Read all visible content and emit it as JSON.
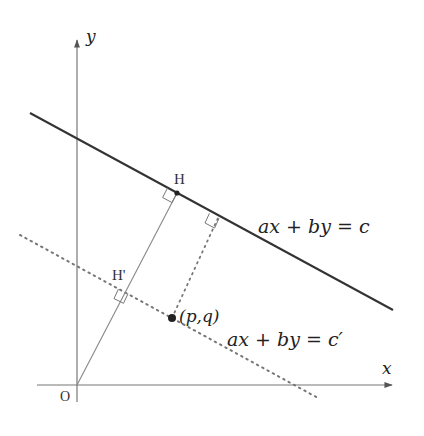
{
  "diagram": {
    "type": "coordinate-geometry",
    "axes": {
      "x_label": "x",
      "y_label": "y",
      "origin_label": "O"
    },
    "lines": {
      "main": {
        "equation": "ax + by = c",
        "style": "solid"
      },
      "parallel": {
        "equation": "ax + by = c′",
        "style": "dotted"
      }
    },
    "points": {
      "H": "H",
      "H_prime": "H'",
      "P": "(p,q)"
    },
    "colors": {
      "axis": "#777777",
      "main_line": "#333333",
      "perp_line": "#888888",
      "dotted": "#777777",
      "text": "#222222"
    }
  }
}
